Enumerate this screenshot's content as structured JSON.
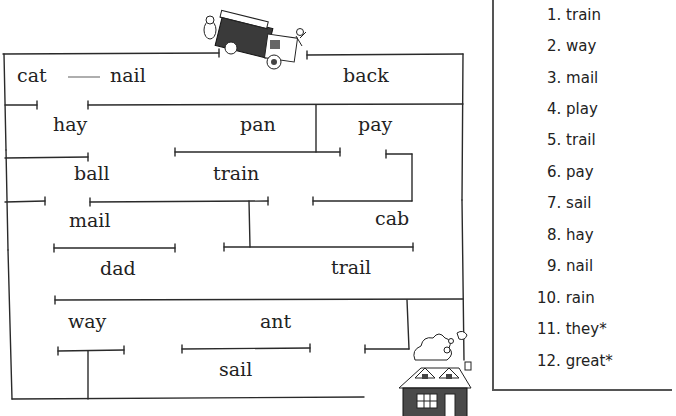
{
  "maze": {
    "start_picture": "fire-truck",
    "end_picture": "house-on-fire",
    "connector": "—",
    "words": [
      {
        "id": "cat",
        "text": "cat"
      },
      {
        "id": "nail",
        "text": "nail"
      },
      {
        "id": "back",
        "text": "back"
      },
      {
        "id": "hay",
        "text": "hay"
      },
      {
        "id": "pan",
        "text": "pan"
      },
      {
        "id": "pay",
        "text": "pay"
      },
      {
        "id": "ball",
        "text": "ball"
      },
      {
        "id": "train",
        "text": "train"
      },
      {
        "id": "mail",
        "text": "mail"
      },
      {
        "id": "cab",
        "text": "cab"
      },
      {
        "id": "dad",
        "text": "dad"
      },
      {
        "id": "trail",
        "text": "trail"
      },
      {
        "id": "way",
        "text": "way"
      },
      {
        "id": "ant",
        "text": "ant"
      },
      {
        "id": "sail",
        "text": "sail"
      }
    ]
  },
  "word_list": {
    "items": [
      {
        "num": "1.",
        "word": "train"
      },
      {
        "num": "2.",
        "word": "way"
      },
      {
        "num": "3.",
        "word": "mail"
      },
      {
        "num": "4.",
        "word": "play"
      },
      {
        "num": "5.",
        "word": "trail"
      },
      {
        "num": "6.",
        "word": "pay"
      },
      {
        "num": "7.",
        "word": "sail"
      },
      {
        "num": "8.",
        "word": "hay"
      },
      {
        "num": "9.",
        "word": "nail"
      },
      {
        "num": "10.",
        "word": "rain"
      },
      {
        "num": "11.",
        "word": "they*"
      },
      {
        "num": "12.",
        "word": "great*"
      }
    ]
  },
  "colors": {
    "line": "#2a2a2a",
    "connector": "#777777",
    "text": "#222222"
  }
}
